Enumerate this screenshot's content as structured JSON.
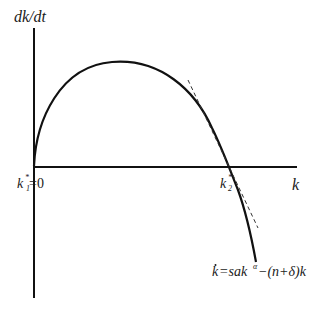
{
  "diagram": {
    "y_axis_label": "dk/dt",
    "x_axis_label": "k",
    "origin_label": {
      "base": "k",
      "star": "*",
      "sub": "1",
      "rest": "=0"
    },
    "k2_label": {
      "base": "k",
      "star": "*",
      "sub": "2"
    },
    "equation": {
      "kdot": "k",
      "rest1": "=sak",
      "exp": "α",
      "rest2": "−(n+δ)k"
    },
    "curve_color": "#111111",
    "tangent_style": "dashed"
  }
}
